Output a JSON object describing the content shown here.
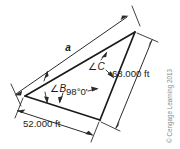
{
  "figure": {
    "type": "surveying-triangle-diagram",
    "title_text": "",
    "labels": {
      "side_a": "a",
      "dim_right": "68.000 ft",
      "dim_bottom": "52.000 ft",
      "angle_b": "B",
      "angle_c": "C",
      "angle_symbol": "∠",
      "angle_a_value": "98°0'"
    },
    "copyright": "© Cengage Learning 2013",
    "colors": {
      "stroke": "#1a1a1a",
      "dimension": "#2b2b2b",
      "text": "#1a1a1a",
      "copyright": "#8a8a8a",
      "background": "#ffffff"
    },
    "geometry": {
      "vertex_b": [
        25,
        96
      ],
      "vertex_a": [
        100,
        120
      ],
      "vertex_c": [
        135,
        32
      ]
    }
  }
}
